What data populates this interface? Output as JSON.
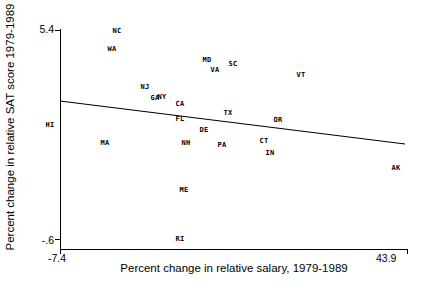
{
  "chart_data": {
    "type": "scatter",
    "title": "",
    "xlabel": "Percent change in relative salary, 1979-1989",
    "ylabel": "Percent change in relative SAT score 1979-1989",
    "xlim": [
      -7.4,
      43.9
    ],
    "ylim": [
      -0.6,
      5.4
    ],
    "xticks": [
      "-7.4",
      "43.9"
    ],
    "yticks": [
      "-.6",
      "5.4"
    ],
    "grid": false,
    "legend": null,
    "point_label_field": "state",
    "points": [
      {
        "state": "NC",
        "x": 5.2,
        "y": 5.3,
        "px": 117,
        "py": 31
      },
      {
        "state": "WA",
        "x": 4.5,
        "y": 5.09,
        "px": 112,
        "py": 49
      },
      {
        "state": "MD",
        "x": 17.5,
        "y": 4.84,
        "px": 207,
        "py": 60
      },
      {
        "state": "SC",
        "x": 23.6,
        "y": 4.78,
        "px": 233,
        "py": 64
      },
      {
        "state": "VA",
        "x": 19.4,
        "y": 4.7,
        "px": 215,
        "py": 70
      },
      {
        "state": "VT",
        "x": 38.1,
        "y": 4.63,
        "px": 301,
        "py": 75
      },
      {
        "state": "NJ",
        "x": 7.1,
        "y": 4.38,
        "px": 145,
        "py": 87
      },
      {
        "state": "GA",
        "x": 10.5,
        "y": 4.22,
        "px": 155,
        "py": 98
      },
      {
        "state": "NY",
        "x": 11.6,
        "y": 4.22,
        "px": 162,
        "py": 97
      },
      {
        "state": "CA",
        "x": 13.9,
        "y": 4.1,
        "px": 180,
        "py": 104
      },
      {
        "state": "TX",
        "x": 23.2,
        "y": 3.94,
        "px": 228,
        "py": 113
      },
      {
        "state": "HI",
        "x": -6.9,
        "y": 3.8,
        "px": 50,
        "py": 125
      },
      {
        "state": "FL",
        "x": 14.2,
        "y": 3.86,
        "px": 180,
        "py": 119
      },
      {
        "state": "OR",
        "x": 32.4,
        "y": 3.84,
        "px": 278,
        "py": 120
      },
      {
        "state": "DE",
        "x": 18.2,
        "y": 3.72,
        "px": 204,
        "py": 130
      },
      {
        "state": "MA",
        "x": 1.7,
        "y": 3.52,
        "px": 105,
        "py": 143
      },
      {
        "state": "NH",
        "x": 15.3,
        "y": 3.52,
        "px": 186,
        "py": 143
      },
      {
        "state": "PA",
        "x": 21.5,
        "y": 3.5,
        "px": 222,
        "py": 145
      },
      {
        "state": "CT",
        "x": 30.5,
        "y": 3.54,
        "px": 264,
        "py": 141
      },
      {
        "state": "IN",
        "x": 31.6,
        "y": 3.38,
        "px": 270,
        "py": 153
      },
      {
        "state": "AK",
        "x": 41.9,
        "y": 3.18,
        "px": 396,
        "py": 168
      },
      {
        "state": "ME",
        "x": 15.9,
        "y": 2.68,
        "px": 184,
        "py": 190
      },
      {
        "state": "RI",
        "x": 15.3,
        "y": -0.56,
        "px": 180,
        "py": 239
      }
    ],
    "fit_line": {
      "name": "linear-fit",
      "x_start": -7.4,
      "y_start": 4.22,
      "x_end": 41.0,
      "y_end": 3.43,
      "px_start": 60,
      "py_start": 101,
      "px_end": 405,
      "py_end": 144
    },
    "axes_pixels": {
      "left": 60,
      "right": 408,
      "top": 30,
      "bottom": 249
    }
  },
  "colors": {
    "axis": "#000000",
    "line": "#000000",
    "label": "#000000",
    "background": "#ffffff"
  }
}
